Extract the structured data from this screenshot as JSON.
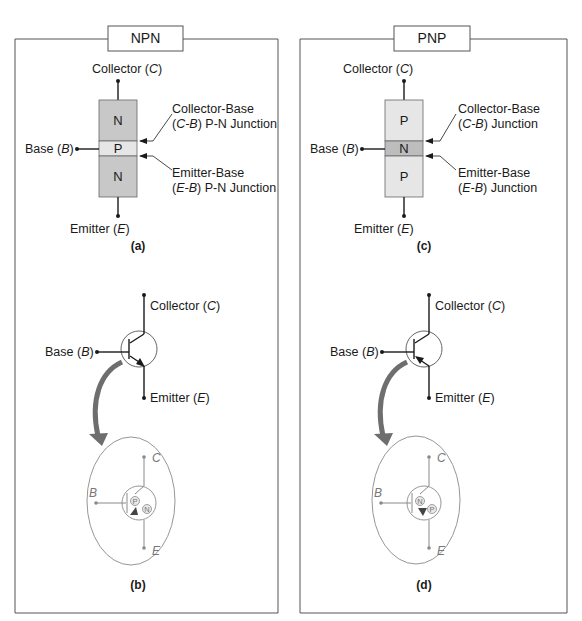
{
  "figure": {
    "panels": [
      {
        "id": "npn",
        "title": "NPN",
        "block": {
          "regions": [
            {
              "label": "N",
              "role": "collector",
              "color": "#c8c8c8"
            },
            {
              "label": "P",
              "role": "base",
              "color": "#e6e6e6"
            },
            {
              "label": "N",
              "role": "emitter",
              "color": "#c8c8c8"
            }
          ],
          "terminals": {
            "collector": {
              "name": "Collector",
              "symbol": "C"
            },
            "base": {
              "name": "Base",
              "symbol": "B"
            },
            "emitter": {
              "name": "Emitter",
              "symbol": "E"
            }
          },
          "junctions": {
            "cb": {
              "line1": "Collector-Base",
              "line2_sym": "C-B",
              "line2_rest": " P-N Junction"
            },
            "eb": {
              "line1": "Emitter-Base",
              "line2_sym": "E-B",
              "line2_rest": " P-N Junction"
            }
          },
          "caption": "(a)"
        },
        "symbol": {
          "collector": {
            "name": "Collector",
            "symbol": "C"
          },
          "base": {
            "name": "Base",
            "symbol": "B"
          },
          "emitter": {
            "name": "Emitter",
            "symbol": "E"
          },
          "arrow_direction": "outward",
          "zoom": {
            "C": "C",
            "B": "B",
            "E": "E",
            "diode_upper": "P",
            "diode_lower": "N"
          },
          "caption": "(b)"
        }
      },
      {
        "id": "pnp",
        "title": "PNP",
        "block": {
          "regions": [
            {
              "label": "P",
              "role": "collector",
              "color": "#e6e6e6"
            },
            {
              "label": "N",
              "role": "base",
              "color": "#bdbdbd"
            },
            {
              "label": "P",
              "role": "emitter",
              "color": "#e6e6e6"
            }
          ],
          "terminals": {
            "collector": {
              "name": "Collector",
              "symbol": "C"
            },
            "base": {
              "name": "Base",
              "symbol": "B"
            },
            "emitter": {
              "name": "Emitter",
              "symbol": "E"
            }
          },
          "junctions": {
            "cb": {
              "line1": "Collector-Base",
              "line2_sym": "C-B",
              "line2_rest": " Junction"
            },
            "eb": {
              "line1": "Emitter-Base",
              "line2_sym": "E-B",
              "line2_rest": " Junction"
            }
          },
          "caption": "(c)"
        },
        "symbol": {
          "collector": {
            "name": "Collector",
            "symbol": "C"
          },
          "base": {
            "name": "Base",
            "symbol": "B"
          },
          "emitter": {
            "name": "Emitter",
            "symbol": "E"
          },
          "arrow_direction": "inward",
          "zoom": {
            "C": "C",
            "B": "B",
            "E": "E",
            "diode_upper": "N",
            "diode_lower": "P"
          },
          "caption": "(d)"
        }
      }
    ],
    "colors": {
      "frame": "#555555",
      "ink": "#1a1a1a",
      "zoom_ink": "#8a8a8a",
      "curved_arrow": "#6e6e6e"
    }
  }
}
